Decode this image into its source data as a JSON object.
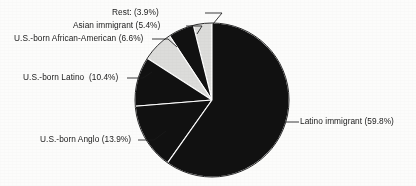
{
  "figure": {
    "background_color": "#fcfcfb",
    "pie": {
      "center_x": 212,
      "center_y": 100,
      "radius": 77,
      "start_angle_deg": 90,
      "direction": "counterclockwise",
      "separator_color": "#ffffff",
      "outline_color": "#111111"
    }
  },
  "chart_data": {
    "type": "pie",
    "title": "",
    "subtitle": "",
    "xlabel": "",
    "ylabel": "",
    "grid": false,
    "legend_position": "none",
    "labels_outside": true,
    "total_percent": 100.0,
    "categories": [
      "Rest:",
      "Asian immigrant",
      "U.S.-born African-American",
      "U.S.-born Latino ",
      "U.S.-born Anglo",
      "Latino immigrant"
    ],
    "values": [
      3.9,
      5.4,
      6.6,
      10.4,
      13.9,
      59.8
    ],
    "slices": [
      {
        "name": "rest",
        "label": "Rest: (3.9%)",
        "category": "Rest:",
        "value": 3.9,
        "value_text": "(3.9%)",
        "color": "#dcdcda",
        "label_x": 112,
        "label_y": 7,
        "leader": [
          [
            205,
            13
          ],
          [
            222,
            13
          ],
          [
            213,
            24
          ]
        ]
      },
      {
        "name": "asian-immigrant",
        "label": "Asian immigrant (5.4%)",
        "category": "Asian immigrant",
        "value": 5.4,
        "value_text": "(5.4%)",
        "color": "#111111",
        "label_x": 73,
        "label_y": 20,
        "leader": [
          [
            186,
            26
          ],
          [
            202,
            26
          ],
          [
            197,
            34
          ]
        ]
      },
      {
        "name": "us-born-african-american",
        "label": "U.S.-born African-American (6.6%)",
        "category": "U.S.-born African-American",
        "value": 6.6,
        "value_text": "(6.6%)",
        "color": "#dcdcda",
        "label_x": 14,
        "label_y": 33,
        "leader": [
          [
            152,
            39
          ],
          [
            168,
            39
          ],
          [
            177,
            47
          ]
        ]
      },
      {
        "name": "us-born-latino",
        "label": "U.S.-born Latino  (10.4%)",
        "category": "U.S.-born Latino ",
        "value": 10.4,
        "value_text": "(10.4%)",
        "color": "#111111",
        "label_x": 23,
        "label_y": 72,
        "leader": [
          [
            127,
            78
          ],
          [
            143,
            78
          ],
          [
            152,
            72
          ]
        ]
      },
      {
        "name": "us-born-anglo",
        "label": "U.S.-born Anglo (13.9%)",
        "category": "U.S.-born Anglo",
        "value": 13.9,
        "value_text": "(13.9%)",
        "color": "#111111",
        "label_x": 40,
        "label_y": 134,
        "leader": [
          [
            138,
            140
          ],
          [
            154,
            140
          ],
          [
            166,
            131
          ]
        ]
      },
      {
        "name": "latino-immigrant",
        "label": "Latino immigrant (59.8%)",
        "category": "Latino immigrant",
        "value": 59.8,
        "value_text": "(59.8%)",
        "color": "#111111",
        "label_x": 300,
        "label_y": 116,
        "leader": [
          [
            283,
            122
          ],
          [
            299,
            122
          ]
        ]
      }
    ]
  }
}
